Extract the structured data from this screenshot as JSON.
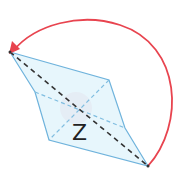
{
  "diagram": {
    "type": "rotated-rhombus-prism-fold",
    "label": "Z",
    "colors": {
      "background": "#ffffff",
      "face_fill": "#dff3fb",
      "edge": "#6fb3dc",
      "hidden_edge": "#7fbde0",
      "diagonal": "#333333",
      "rotation_arrow": "#e8444f",
      "angle_marker": "#f7d3dc",
      "label": "#222222"
    },
    "vertices": {
      "top_left": [
        10,
        52
      ],
      "upper_right": [
        109,
        80
      ],
      "right_mid": [
        125,
        128
      ],
      "bottom_right": [
        148,
        166
      ],
      "bottom_left": [
        49,
        140
      ],
      "left_mid": [
        35,
        92
      ]
    },
    "arrow": {
      "description": "curved arrow rotating from bottom-right vertex clockwise-back to top-left vertex"
    }
  }
}
